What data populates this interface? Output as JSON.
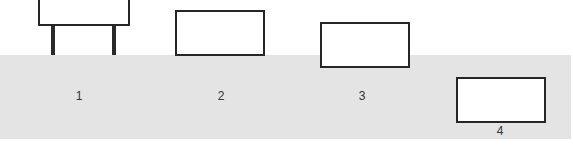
{
  "diagram": {
    "title": "",
    "items": [
      {
        "label": "1",
        "description": "rectangle raised on two legs above the surface"
      },
      {
        "label": "2",
        "description": "rectangle resting on the surface"
      },
      {
        "label": "3",
        "description": "rectangle partially sunk into the surface"
      },
      {
        "label": "4",
        "description": "rectangle fully submerged in the surface"
      }
    ],
    "colors": {
      "surface": "#e4e4e4",
      "outline": "#262626",
      "box_fill": "#ffffff"
    }
  }
}
